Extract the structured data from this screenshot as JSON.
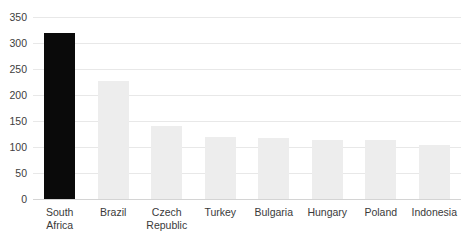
{
  "chart_data": {
    "type": "bar",
    "title": "",
    "subtitle": "",
    "xlabel": "",
    "ylabel": "",
    "categories": [
      "South\nAfrica",
      "Brazil",
      "Czech\nRepublic",
      "Turkey",
      "Bulgaria",
      "Hungary",
      "Poland",
      "Indonesia"
    ],
    "values": [
      319,
      227,
      140,
      119,
      117,
      113,
      113,
      104
    ],
    "bar_colors": [
      "#0a0a0a",
      "#ededed",
      "#ededed",
      "#ededed",
      "#ededed",
      "#ededed",
      "#ededed",
      "#ededed"
    ],
    "highlight_index": 0,
    "highlight_color": "#0a0a0a",
    "series_color": "#ededed",
    "ylim": [
      0,
      350
    ],
    "yticks": [
      0,
      50,
      100,
      150,
      200,
      250,
      300,
      350
    ],
    "ytick_labels": [
      "0",
      "50",
      "100",
      "150",
      "200",
      "250",
      "300",
      "350"
    ],
    "grid": true,
    "grid_axis": "y",
    "grid_color": "#e8e8e8",
    "baseline_color": "#d4d4d4",
    "legend": null,
    "legend_position": "none",
    "annotations": []
  }
}
